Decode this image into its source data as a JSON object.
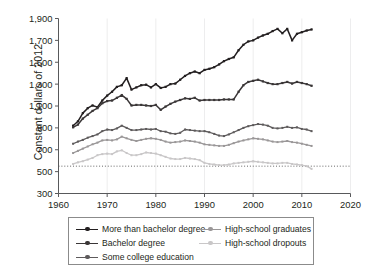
{
  "chart_data": {
    "type": "line",
    "title": "",
    "xlabel": "",
    "ylabel": "Constant dollars of 2012",
    "xlim": [
      1960,
      2020
    ],
    "ylim": [
      300,
      1900
    ],
    "xticks": [
      1960,
      1970,
      1980,
      1990,
      2000,
      2010,
      2020
    ],
    "xtick_labels": [
      "1960",
      "1970",
      "1980",
      "1990",
      "2000",
      "2010",
      "2020"
    ],
    "yticks": [
      300,
      500,
      700,
      900,
      1100,
      1300,
      1500,
      1700,
      1900
    ],
    "ytick_labels": [
      "300",
      "500",
      "700",
      "900",
      "1,100",
      "1,300",
      "1,500",
      "1,700",
      "1,900"
    ],
    "grid": "faint vertical gridlines at x decade ticks",
    "legend_position": "below-axes",
    "reference_line": {
      "y": 550,
      "style": "dotted",
      "color": "#555555"
    },
    "x": [
      1963,
      1964,
      1965,
      1966,
      1967,
      1968,
      1969,
      1970,
      1971,
      1972,
      1973,
      1974,
      1975,
      1976,
      1977,
      1978,
      1979,
      1980,
      1981,
      1982,
      1983,
      1984,
      1985,
      1986,
      1987,
      1988,
      1989,
      1990,
      1991,
      1992,
      1993,
      1994,
      1995,
      1996,
      1997,
      1998,
      1999,
      2000,
      2001,
      2002,
      2003,
      2004,
      2005,
      2006,
      2007,
      2008,
      2009,
      2010,
      2011,
      2012
    ],
    "series": [
      {
        "name": "More than bachelor degree",
        "color": "#231f20",
        "marker": "square",
        "values": [
          920,
          960,
          1035,
          1080,
          1105,
          1090,
          1150,
          1195,
          1230,
          1275,
          1290,
          1355,
          1250,
          1270,
          1290,
          1295,
          1270,
          1300,
          1265,
          1275,
          1300,
          1305,
          1340,
          1375,
          1400,
          1415,
          1400,
          1430,
          1440,
          1455,
          1480,
          1510,
          1530,
          1545,
          1610,
          1660,
          1690,
          1700,
          1725,
          1745,
          1760,
          1785,
          1805,
          1765,
          1805,
          1700,
          1760,
          1775,
          1790,
          1800
        ]
      },
      {
        "name": "Bachelor degree",
        "color": "#3a3637",
        "marker": "square",
        "values": [
          905,
          930,
          985,
          1020,
          1055,
          1080,
          1125,
          1145,
          1150,
          1175,
          1200,
          1165,
          1105,
          1110,
          1110,
          1105,
          1100,
          1110,
          1065,
          1095,
          1120,
          1140,
          1155,
          1170,
          1165,
          1175,
          1150,
          1155,
          1155,
          1155,
          1155,
          1160,
          1160,
          1160,
          1230,
          1290,
          1320,
          1330,
          1340,
          1325,
          1310,
          1300,
          1300,
          1310,
          1320,
          1305,
          1320,
          1310,
          1300,
          1285
        ]
      },
      {
        "name": "Some college education",
        "color": "#5d5a5b",
        "marker": "square",
        "values": [
          755,
          775,
          790,
          810,
          825,
          840,
          870,
          885,
          880,
          895,
          920,
          900,
          880,
          880,
          885,
          890,
          885,
          890,
          870,
          865,
          850,
          845,
          855,
          885,
          880,
          875,
          870,
          870,
          860,
          845,
          830,
          825,
          840,
          860,
          880,
          900,
          915,
          925,
          935,
          930,
          920,
          900,
          895,
          900,
          910,
          900,
          905,
          890,
          885,
          870
        ]
      },
      {
        "name": "High-school graduates",
        "color": "#9a9798",
        "marker": "square",
        "values": [
          670,
          690,
          710,
          730,
          750,
          765,
          785,
          790,
          785,
          795,
          820,
          805,
          790,
          780,
          790,
          800,
          805,
          800,
          790,
          775,
          765,
          770,
          775,
          785,
          780,
          775,
          765,
          750,
          745,
          740,
          735,
          735,
          745,
          760,
          775,
          785,
          795,
          805,
          800,
          795,
          785,
          775,
          770,
          775,
          780,
          770,
          765,
          755,
          745,
          735
        ]
      },
      {
        "name": "High-school dropouts",
        "color": "#c9c7c8",
        "marker": "square",
        "values": [
          570,
          585,
          595,
          610,
          625,
          650,
          660,
          665,
          660,
          685,
          695,
          670,
          650,
          650,
          660,
          675,
          670,
          665,
          650,
          635,
          620,
          615,
          615,
          625,
          620,
          615,
          605,
          580,
          570,
          565,
          560,
          560,
          565,
          575,
          580,
          585,
          590,
          595,
          590,
          585,
          580,
          575,
          575,
          580,
          580,
          570,
          565,
          560,
          550,
          525
        ]
      }
    ]
  },
  "legend": {
    "items": [
      {
        "label": "More than bachelor degree",
        "column": "left"
      },
      {
        "label": "Bachelor degree",
        "column": "left"
      },
      {
        "label": "Some college education",
        "column": "left"
      },
      {
        "label": "High-school graduates",
        "column": "right"
      },
      {
        "label": "High-school dropouts",
        "column": "right"
      }
    ]
  }
}
